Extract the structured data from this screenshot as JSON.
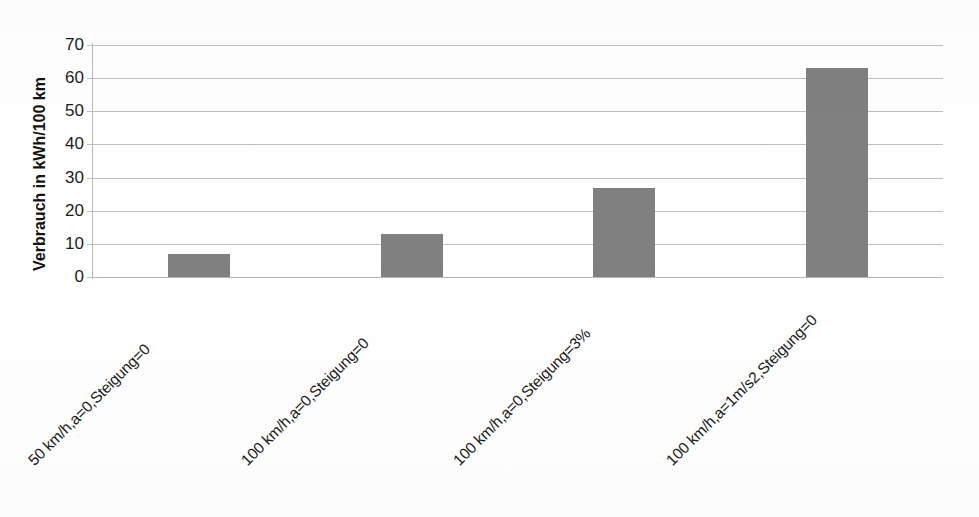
{
  "chart_data": {
    "type": "bar",
    "title": "",
    "xlabel": "",
    "ylabel": "Verbrauch in kWh/100 km",
    "categories": [
      "50 km/h,a=0,Steigung=0",
      "100 km/h,a=0,Steigung=0",
      "100 km/h,a=0,Steigung=3%",
      "100 km/h,a=1m/s2,Steigung=0"
    ],
    "values": [
      7,
      13,
      27,
      63
    ],
    "ylim": [
      0,
      70
    ],
    "yticks": [
      0,
      10,
      20,
      30,
      40,
      50,
      60,
      70
    ],
    "ytick_labels": [
      "0",
      "10",
      "20",
      "30",
      "40",
      "50",
      "60",
      "70"
    ],
    "grid": true,
    "legend": false,
    "legend_position": "none",
    "bar_color": "#808080",
    "gridline_color": "#bfbfbf",
    "axis_color": "#b9b9b9",
    "text_color": "#1c1c1c",
    "background_color": "#ffffff"
  },
  "axis": {
    "y_title": "Verbrauch in kWh/100 km"
  }
}
